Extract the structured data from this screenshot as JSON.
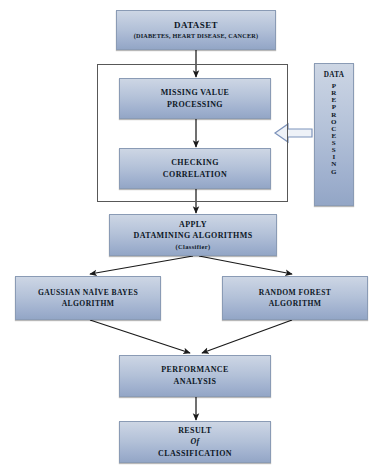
{
  "diagram": {
    "background_color": "#ffffff",
    "box_fill_top": "#cdd6e4",
    "box_fill_bottom": "#93a6c6",
    "box_border_color": "#8a9bb5",
    "connector_color": "#1a1a1a",
    "group_border_color": "#585858",
    "callout_arrow_color": "#7d93bb"
  },
  "nodes": {
    "dataset": {
      "title": "DATASET",
      "subtitle": "(DIABETES, HEART DISEASE, CANCER)"
    },
    "missing_value": {
      "line1": "MISSING VALUE",
      "line2": "PROCESSING"
    },
    "checking_correlation": {
      "line1": "CHECKING",
      "line2": "CORRELATION"
    },
    "apply": {
      "line1": "APPLY",
      "line2": "DATAMINING ALGORITHMS",
      "line3": "(Classifier)"
    },
    "gaussian_naive_bayes": {
      "line1": "GAUSSIAN NAÏVE BAYES",
      "line2": "ALGORITHM"
    },
    "random_forest": {
      "line1": "RANDOM FOREST",
      "line2": "ALGORITHM"
    },
    "performance": {
      "line1": "PERFORMANCE",
      "line2": "ANALYSIS"
    },
    "result": {
      "line1": "RESULT",
      "line2": "Of",
      "line3": "CLASSIFICATION"
    },
    "preprocessing_callout": {
      "head": "DATA",
      "vertical_label": "PREPROCESSING",
      "letters": [
        "P",
        "R",
        "E",
        "P",
        "R",
        "O",
        "C",
        "E",
        "S",
        "S",
        "I",
        "N",
        "G"
      ]
    }
  }
}
